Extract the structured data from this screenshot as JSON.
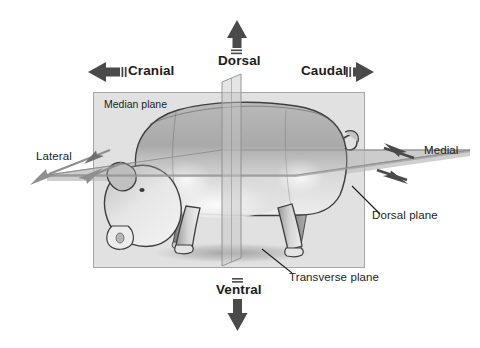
{
  "figure": {
    "background_color": "#ffffff",
    "box_fill_color": "#e8e8e8",
    "box_border_color": "#9a9a9a",
    "plane_fill_color": "#c9c9c9",
    "arrow_color": "#4a4a4a",
    "text_color": "#1c1c1c"
  },
  "direction_labels": {
    "dorsal": {
      "text": "Dorsal",
      "arrow": "up-arrow-icon",
      "direction": "up"
    },
    "ventral": {
      "text": "Ventral",
      "arrow": "down-arrow-icon",
      "direction": "down"
    },
    "cranial": {
      "text": "Cranial",
      "arrow": "left-arrow-icon",
      "direction": "left"
    },
    "caudal": {
      "text": "Caudal",
      "arrow": "right-arrow-icon",
      "direction": "right"
    },
    "lateral": {
      "text": "Lateral",
      "arrow": "diagonal-double-arrow-icon",
      "direction": "outward-left"
    },
    "medial": {
      "text": "Medial",
      "arrow": "diagonal-double-arrow-icon",
      "direction": "inward-right"
    }
  },
  "plane_labels": {
    "median": {
      "text": "Median plane",
      "placement": "inside-box-top-left"
    },
    "dorsal": {
      "text": "Dorsal plane",
      "placement": "outside-box-right",
      "leader_line": true
    },
    "transverse": {
      "text": "Transverse plane",
      "placement": "outside-box-bottom",
      "leader_line": true
    }
  }
}
